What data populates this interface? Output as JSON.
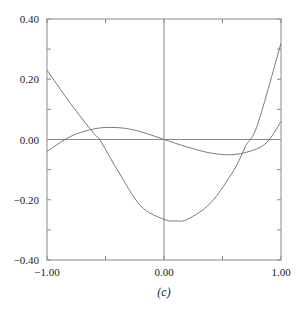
{
  "chart_data": {
    "type": "line",
    "title": "",
    "caption": "(c)",
    "xlabel": "",
    "ylabel": "",
    "xlim": [
      -1.0,
      1.0
    ],
    "ylim": [
      -0.4,
      0.4
    ],
    "x_ticks": [
      -1.0,
      -0.5,
      0.0,
      0.5,
      1.0
    ],
    "x_tick_labels": [
      "-1.00",
      "",
      "0.00",
      "",
      "1.00"
    ],
    "y_ticks": [
      -0.4,
      -0.3,
      -0.2,
      -0.1,
      0.0,
      0.1,
      0.2,
      0.3,
      0.4
    ],
    "y_tick_labels": [
      "−0.40",
      "",
      "−0.20",
      "",
      "0.00",
      "",
      "0.20",
      "",
      "0.40"
    ],
    "grid": false,
    "zero_lines": true,
    "legend": null,
    "series": [
      {
        "name": "curve-1",
        "x": [
          -1.0,
          -0.8,
          -0.6,
          -0.55,
          -0.4,
          -0.2,
          0.0,
          0.1,
          0.2,
          0.4,
          0.6,
          0.7,
          0.8,
          1.0
        ],
        "y": [
          0.23,
          0.12,
          0.02,
          0.0,
          -0.1,
          -0.22,
          -0.265,
          -0.27,
          -0.265,
          -0.21,
          -0.1,
          -0.02,
          0.05,
          0.32
        ]
      },
      {
        "name": "curve-2",
        "x": [
          -1.0,
          -0.8,
          -0.6,
          -0.45,
          -0.3,
          -0.15,
          0.0,
          0.2,
          0.4,
          0.6,
          0.8,
          0.9,
          1.0
        ],
        "y": [
          -0.04,
          0.01,
          0.035,
          0.04,
          0.035,
          0.02,
          0.0,
          -0.025,
          -0.045,
          -0.05,
          -0.03,
          0.0,
          0.06
        ]
      }
    ],
    "colors": {
      "frame": "#8a8a8a",
      "curves": "#7a7a7a",
      "text": "#222222"
    }
  }
}
